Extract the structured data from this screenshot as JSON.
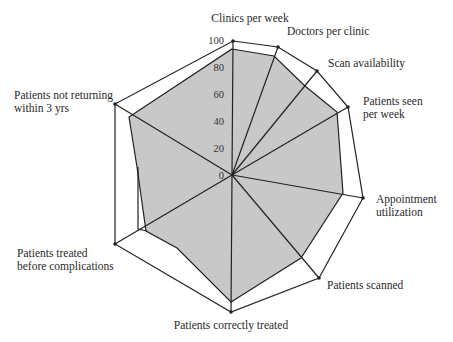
{
  "chart_data": {
    "type": "radar",
    "title": "",
    "scale": {
      "min": 0,
      "max": 100,
      "ticks": [
        0,
        20,
        40,
        60,
        80,
        100
      ]
    },
    "grid": false,
    "legend": null,
    "axes": [
      {
        "label": "Clinics per week",
        "label_lines": [
          "Clinics per week"
        ]
      },
      {
        "label": "Doctors per clinic",
        "label_lines": [
          "Doctors per clinic"
        ]
      },
      {
        "label": "Scan availability",
        "label_lines": [
          "Scan availability"
        ]
      },
      {
        "label": "Patients seen per week",
        "label_lines": [
          "Patients seen",
          "per week"
        ]
      },
      {
        "label": "Appointment utilization",
        "label_lines": [
          "Appointment",
          "utilization"
        ]
      },
      {
        "label": "Patients scanned",
        "label_lines": [
          "Patients scanned"
        ]
      },
      {
        "label": "Patients correctly treated",
        "label_lines": [
          "Patients correctly treated"
        ]
      },
      {
        "label": "Patients treated before complications",
        "label_lines": [
          "Patients treated",
          "before complications"
        ]
      },
      {
        "label": "Patients not returning within 3 yrs",
        "label_lines": [
          "Patients not returning",
          "within 3 yrs"
        ]
      }
    ],
    "series": [
      {
        "name": "Maximum",
        "values": [
          100,
          100,
          100,
          100,
          100,
          100,
          100,
          100,
          100
        ]
      },
      {
        "name": "Actual",
        "values": [
          94,
          92,
          82,
          90,
          85,
          78,
          93,
          72,
          85
        ]
      }
    ]
  },
  "geometry": {
    "center": [
      232,
      175
    ],
    "outer": [
      [
        233,
        41
      ],
      [
        278,
        47
      ],
      [
        317,
        71
      ],
      [
        348,
        107
      ],
      [
        363,
        198
      ],
      [
        319,
        278
      ],
      [
        231,
        312
      ],
      [
        115,
        244
      ],
      [
        115,
        104
      ]
    ],
    "actual": [
      [
        232,
        49
      ],
      [
        274,
        56
      ],
      [
        305,
        86
      ],
      [
        337,
        112
      ],
      [
        343,
        193
      ],
      [
        301,
        258
      ],
      [
        231,
        302
      ],
      [
        177,
        248
      ],
      [
        146,
        231
      ],
      [
        137,
        167
      ],
      [
        129,
        117
      ]
    ],
    "inner_marker": [
      [
        138,
        167
      ],
      [
        138,
        229
      ],
      [
        147,
        231
      ]
    ],
    "label_pos": [
      [
        250,
        22,
        "middle"
      ],
      [
        287,
        35,
        "start"
      ],
      [
        328,
        67,
        "start"
      ],
      [
        363,
        105,
        "start"
      ],
      [
        376,
        203,
        "start"
      ],
      [
        327,
        289,
        "start"
      ],
      [
        231,
        329,
        "middle"
      ],
      [
        17,
        257,
        "start"
      ],
      [
        14,
        99,
        "start"
      ]
    ],
    "tick_pos": [
      [
        224,
        179
      ],
      [
        224,
        152
      ],
      [
        224,
        125
      ],
      [
        224,
        98
      ],
      [
        224,
        71
      ],
      [
        224,
        44
      ]
    ]
  }
}
